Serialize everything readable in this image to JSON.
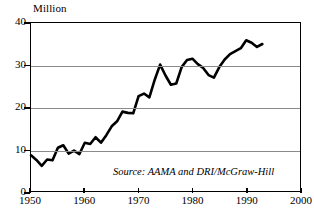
{
  "chart_data": {
    "type": "line",
    "title": "",
    "subtitle": "",
    "xlabel": "",
    "ylabel": "Million",
    "unit_label": "Million",
    "xlim": [
      1950,
      2000
    ],
    "ylim": [
      0,
      40
    ],
    "grid": true,
    "legend": null,
    "legend_position": "none",
    "annotations": [
      {
        "name": "source-note",
        "text": "Source: AAMA and DRI/McGraw-Hill",
        "x": 1970,
        "y": 4
      }
    ],
    "x_ticks": [
      1950,
      1960,
      1970,
      1980,
      1990,
      2000
    ],
    "x_tick_labels": [
      "1950",
      "1960",
      "1970",
      "1980",
      "1990",
      "2000"
    ],
    "y_ticks": [
      0,
      10,
      20,
      30,
      40
    ],
    "y_tick_labels": [
      "0",
      "10",
      "20",
      "30",
      "40"
    ],
    "gridline_values": [
      10,
      20,
      30
    ],
    "series": [
      {
        "name": "Vehicle sales",
        "color": "#000000",
        "x": [
          1950,
          1951,
          1952,
          1953,
          1954,
          1955,
          1956,
          1957,
          1958,
          1959,
          1960,
          1961,
          1962,
          1963,
          1964,
          1965,
          1966,
          1967,
          1968,
          1969,
          1970,
          1971,
          1972,
          1973,
          1974,
          1975,
          1976,
          1977,
          1978,
          1979,
          1980,
          1981,
          1982,
          1983,
          1984,
          1985,
          1986,
          1987,
          1988,
          1989,
          1990,
          1991,
          1992,
          1993
        ],
        "values": [
          8.5,
          7.4,
          6.0,
          7.5,
          7.3,
          10.3,
          10.9,
          8.9,
          9.6,
          8.8,
          11.5,
          11.2,
          12.8,
          11.5,
          13.3,
          15.4,
          16.6,
          18.9,
          18.6,
          18.5,
          22.6,
          23.2,
          22.3,
          26.5,
          30.1,
          27.5,
          25.3,
          25.6,
          29.5,
          31.2,
          31.5,
          30.2,
          29.3,
          27.6,
          27.0,
          29.5,
          31.3,
          32.6,
          33.3,
          34.0,
          35.9,
          35.3,
          34.3,
          35.0
        ]
      }
    ]
  }
}
